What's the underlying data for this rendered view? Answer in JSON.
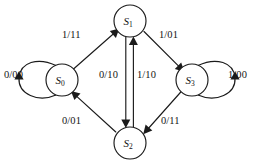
{
  "diagram": {
    "kind": "state-transition-diagram",
    "stroke_color": "#1b1b1b",
    "background_color": "#ffffff",
    "states": [
      {
        "id": "S0",
        "name": "S",
        "subscript": "0",
        "cx": 62,
        "cy": 80,
        "r": 16
      },
      {
        "id": "S1",
        "name": "S",
        "subscript": "1",
        "cx": 130,
        "cy": 21,
        "r": 16
      },
      {
        "id": "S2",
        "name": "S",
        "subscript": "2",
        "cx": 130,
        "cy": 143,
        "r": 16
      },
      {
        "id": "S3",
        "name": "S",
        "subscript": "3",
        "cx": 192,
        "cy": 80,
        "r": 16
      }
    ],
    "transitions": [
      {
        "id": "t-s0-s0",
        "from": "S0",
        "to": "S0",
        "label": "0/00",
        "shape": "self-loop-left",
        "label_x": 4,
        "label_y": 70
      },
      {
        "id": "t-s0-s1",
        "from": "S0",
        "to": "S1",
        "label": "1/11",
        "shape": "diagonal",
        "label_x": 62,
        "label_y": 30
      },
      {
        "id": "t-s1-s3",
        "from": "S1",
        "to": "S3",
        "label": "1/01",
        "shape": "diagonal",
        "label_x": 159,
        "label_y": 30
      },
      {
        "id": "t-s3-s3",
        "from": "S3",
        "to": "S3",
        "label": "1/00",
        "shape": "self-loop-right",
        "label_x": 228,
        "label_y": 70
      },
      {
        "id": "t-s1-s2",
        "from": "S1",
        "to": "S2",
        "label": "0/10",
        "shape": "vertical-down",
        "label_x": 99,
        "label_y": 70
      },
      {
        "id": "t-s2-s1",
        "from": "S2",
        "to": "S1",
        "label": "1/10",
        "shape": "vertical-up",
        "label_x": 137,
        "label_y": 70
      },
      {
        "id": "t-s2-s0",
        "from": "S2",
        "to": "S0",
        "label": "0/01",
        "shape": "diagonal",
        "label_x": 62,
        "label_y": 116
      },
      {
        "id": "t-s3-s2",
        "from": "S3",
        "to": "S2",
        "label": "0/11",
        "shape": "diagonal",
        "label_x": 161,
        "label_y": 116
      }
    ]
  }
}
